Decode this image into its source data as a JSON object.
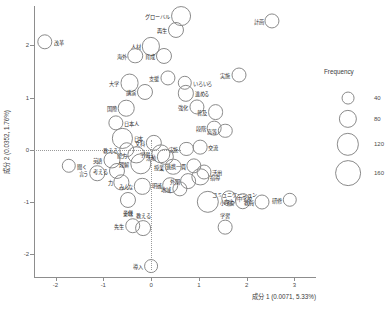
{
  "chart_data": {
    "type": "scatter",
    "title": "",
    "xlabel": "成分 1 (0.0071, 5.33%)",
    "ylabel": "成分 2 (0.0352, 1.76%)",
    "xlim": [
      -2.45,
      3.45
    ],
    "ylim": [
      -2.45,
      2.75
    ],
    "xticks": [
      -2,
      -1,
      0,
      1,
      2,
      3
    ],
    "xticklabels": [
      "-2",
      "-1",
      "0",
      "1",
      "2",
      "3"
    ],
    "yticks": [
      -2,
      -1,
      0,
      1,
      2
    ],
    "yticklabels": [
      "-2",
      "-1",
      "0",
      "1",
      "2"
    ],
    "grid": false,
    "guides": {
      "h": 0,
      "v": 0
    },
    "size_key": "frequency",
    "legend": {
      "title": "Frequency",
      "position": "right",
      "values": [
        40,
        80,
        120,
        160
      ]
    },
    "points": [
      {
        "label": "グローバル",
        "x": 0.62,
        "y": 2.56,
        "freq": 95,
        "pos": "left"
      },
      {
        "label": "再生",
        "x": 0.52,
        "y": 2.3,
        "freq": 62,
        "pos": "left"
      },
      {
        "label": "計画",
        "x": 2.53,
        "y": 2.47,
        "freq": 55,
        "pos": "left"
      },
      {
        "label": "改革",
        "x": -2.22,
        "y": 2.07,
        "freq": 57,
        "pos": "right"
      },
      {
        "label": "人材",
        "x": 0.0,
        "y": 1.98,
        "freq": 80,
        "pos": "left"
      },
      {
        "label": "海外",
        "x": -0.33,
        "y": 1.8,
        "freq": 58,
        "pos": "left"
      },
      {
        "label": "育成",
        "x": 0.26,
        "y": 1.79,
        "freq": 62,
        "pos": "left"
      },
      {
        "label": "大学",
        "x": -0.45,
        "y": 1.28,
        "freq": 86,
        "pos": "left"
      },
      {
        "label": "講演",
        "x": -0.13,
        "y": 1.1,
        "freq": 62,
        "pos": "left"
      },
      {
        "label": "支援",
        "x": 0.35,
        "y": 1.38,
        "freq": 55,
        "pos": "left"
      },
      {
        "label": "いろいろ",
        "x": 0.7,
        "y": 1.28,
        "freq": 50,
        "pos": "right"
      },
      {
        "label": "進める",
        "x": 0.72,
        "y": 1.08,
        "freq": 64,
        "pos": "right"
      },
      {
        "label": "実施",
        "x": 1.83,
        "y": 1.43,
        "freq": 54,
        "pos": "left"
      },
      {
        "label": "国際",
        "x": -0.52,
        "y": 0.8,
        "freq": 66,
        "pos": "left"
      },
      {
        "label": "強化",
        "x": 0.95,
        "y": 0.82,
        "freq": 55,
        "pos": "left"
      },
      {
        "label": "普及",
        "x": 1.35,
        "y": 0.72,
        "freq": 60,
        "pos": "left"
      },
      {
        "label": "日本人",
        "x": -0.74,
        "y": 0.52,
        "freq": 56,
        "pos": "right"
      },
      {
        "label": "段階",
        "x": 1.32,
        "y": 0.42,
        "freq": 52,
        "pos": "left"
      },
      {
        "label": "高等",
        "x": 1.55,
        "y": 0.36,
        "freq": 50,
        "pos": "left"
      },
      {
        "label": "日本",
        "x": -0.6,
        "y": 0.22,
        "freq": 98,
        "pos": "right"
      },
      {
        "label": "文科",
        "x": 0.06,
        "y": 0.14,
        "freq": 64,
        "pos": "left"
      },
      {
        "label": "交流",
        "x": 1.02,
        "y": 0.05,
        "freq": 52,
        "pos": "right"
      },
      {
        "label": "実施2",
        "x": 0.74,
        "y": 0.02,
        "freq": 48,
        "pos": "left"
      },
      {
        "label": "教える2",
        "x": -0.51,
        "y": 0.0,
        "freq": 58,
        "pos": "left"
      },
      {
        "label": "能力",
        "x": -0.31,
        "y": -0.1,
        "freq": 72,
        "pos": "left"
      },
      {
        "label": "学習2",
        "x": 0.2,
        "y": -0.08,
        "freq": 90,
        "pos": "left"
      },
      {
        "label": "活動",
        "x": 0.3,
        "y": -0.13,
        "freq": 64,
        "pos": "left"
      },
      {
        "label": "英語",
        "x": -0.82,
        "y": -0.2,
        "freq": 70,
        "pos": "left"
      },
      {
        "label": "聞く",
        "x": -1.72,
        "y": -0.3,
        "freq": 50,
        "pos": "right"
      },
      {
        "label": "言う",
        "x": -1.13,
        "y": -0.45,
        "freq": 58,
        "pos": "left"
      },
      {
        "label": "考える",
        "x": -0.72,
        "y": -0.4,
        "freq": 62,
        "pos": "left"
      },
      {
        "label": "理解",
        "x": -0.22,
        "y": -0.27,
        "freq": 110,
        "pos": "left"
      },
      {
        "label": "授業",
        "x": 0.46,
        "y": -0.32,
        "freq": 66,
        "pos": "left"
      },
      {
        "label": "連携一貫",
        "x": 0.9,
        "y": -0.3,
        "freq": 56,
        "pos": "left"
      },
      {
        "label": "活用",
        "x": 1.1,
        "y": -0.42,
        "freq": 54,
        "pos": "right"
      },
      {
        "label": "指導",
        "x": 1.03,
        "y": -0.52,
        "freq": 72,
        "pos": "right"
      },
      {
        "label": "力",
        "x": -0.62,
        "y": -0.62,
        "freq": 56,
        "pos": "left"
      },
      {
        "label": "みんな",
        "x": -0.18,
        "y": -0.7,
        "freq": 64,
        "pos": "left"
      },
      {
        "label": "明確",
        "x": 0.4,
        "y": -0.68,
        "freq": 58,
        "pos": "left"
      },
      {
        "label": "外国",
        "x": 0.78,
        "y": -0.6,
        "freq": 60,
        "pos": "left"
      },
      {
        "label": "地域",
        "x": 0.6,
        "y": -0.75,
        "freq": 56,
        "pos": "left"
      },
      {
        "label": "子供",
        "x": -0.48,
        "y": -0.96,
        "freq": 62,
        "pos": "below"
      },
      {
        "label": "意味",
        "x": -0.48,
        "y": -1.08,
        "freq": 0,
        "pos": "below"
      },
      {
        "label": "コミュニケーション",
        "x": 1.2,
        "y": -0.84,
        "freq": 0,
        "pos": "right"
      },
      {
        "label": "小学校",
        "x": 1.18,
        "y": -1.0,
        "freq": 120,
        "pos": "right"
      },
      {
        "label": "中学校",
        "x": 1.62,
        "y": -0.93,
        "freq": 56,
        "pos": "right"
      },
      {
        "label": "向上",
        "x": 1.92,
        "y": -0.98,
        "freq": 58,
        "pos": "left"
      },
      {
        "label": "教員",
        "x": 2.32,
        "y": -1.0,
        "freq": 54,
        "pos": "left"
      },
      {
        "label": "研修",
        "x": 2.9,
        "y": -0.95,
        "freq": 50,
        "pos": "left"
      },
      {
        "label": "先生",
        "x": -0.38,
        "y": -1.45,
        "freq": 58,
        "pos": "left"
      },
      {
        "label": "教える",
        "x": -0.16,
        "y": -1.5,
        "freq": 60,
        "pos": "above"
      },
      {
        "label": "学習",
        "x": 1.55,
        "y": -1.48,
        "freq": 52,
        "pos": "above"
      },
      {
        "label": "導入",
        "x": 0.0,
        "y": -2.22,
        "freq": 46,
        "pos": "left"
      }
    ]
  }
}
